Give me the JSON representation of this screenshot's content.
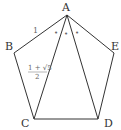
{
  "diagram": {
    "vertices": [
      {
        "id": "A",
        "label": "A"
      },
      {
        "id": "B",
        "label": "B"
      },
      {
        "id": "C",
        "label": "C"
      },
      {
        "id": "D",
        "label": "D"
      },
      {
        "id": "E",
        "label": "E"
      }
    ],
    "edges": [
      [
        "A",
        "B"
      ],
      [
        "B",
        "C"
      ],
      [
        "C",
        "D"
      ],
      [
        "D",
        "E"
      ],
      [
        "E",
        "A"
      ],
      [
        "A",
        "C"
      ],
      [
        "A",
        "D"
      ]
    ],
    "side_label": "1",
    "diagonal_label": {
      "numerator": "1 + √5",
      "denominator": "2"
    },
    "angle_marks": [
      "•",
      "•",
      "•"
    ]
  }
}
